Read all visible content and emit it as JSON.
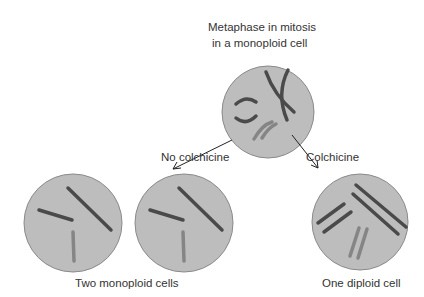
{
  "title_line1": "Metaphase in mitosis",
  "title_line2": "in a monoploid cell",
  "left_arrow_label": "No colchicine",
  "right_arrow_label": "Colchicine",
  "left_caption": "Two monoploid cells",
  "right_caption": "One diploid cell",
  "colors": {
    "cell_fill": "#bdbdbd",
    "cell_stroke": "#8a8a8a",
    "chrom_dark": "#4a4a4a",
    "chrom_light": "#858585"
  }
}
